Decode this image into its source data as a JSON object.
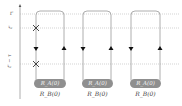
{
  "diagram": {
    "type": "keldysh-contour-loops",
    "axis": {
      "labels": {
        "top": "t'",
        "upper": "t'",
        "lower": "t' − τ"
      }
    },
    "time_levels": [
      {
        "name": "top",
        "y": 14
      },
      {
        "name": "upper",
        "y": 28
      },
      {
        "name": "lower",
        "y": 64
      }
    ],
    "loops": [
      {
        "left_x": 36,
        "right_x": 64,
        "oval_label": "R_A(0)",
        "sub_label": "R_B(0)",
        "crosses": true
      },
      {
        "left_x": 83,
        "right_x": 111,
        "oval_label": "R_A(0)",
        "sub_label": "R_B(0)",
        "crosses": false
      },
      {
        "left_x": 131,
        "right_x": 160,
        "oval_label": "R_A(0)",
        "sub_label": "R_B(0)",
        "crosses": false
      }
    ],
    "oval_labels": [
      "R_A(0)",
      "R_A(0)",
      "R_A(0)"
    ],
    "sub_labels": [
      "R_B(0)",
      "R_B(0)",
      "R_B(0)"
    ],
    "markers": {
      "cross_upper": "×",
      "cross_lower": "×",
      "arrow_down": "down-arrow",
      "arrow_up": "up-arrow"
    },
    "colors": {
      "line": "#9a9a9a",
      "dotted": "#b5b5b5",
      "oval": "#8f8f8f",
      "arrow": "#111111"
    }
  }
}
